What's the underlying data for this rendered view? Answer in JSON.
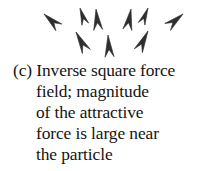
{
  "figure": {
    "label": "(c)",
    "background_color": "#ffffff",
    "ink_color": "#2e2e2e",
    "text_color": "#141414",
    "caption_lines": [
      "(c) Inverse square force",
      "field; magnitude",
      "of the attractive",
      "force is large near",
      "the particle"
    ],
    "caption_full_text": "(c) Inverse square force field; magnitude of the attractive force is large near the particle"
  },
  "vector_field": {
    "type": "inverse-square-attractive",
    "description": "Arrows converge toward a particle located above the visible crop",
    "convergence_point": {
      "x": 112,
      "y": -14
    },
    "arrow_count": 8,
    "arrows": [
      {
        "name": "arrow-upper-left-outer",
        "x": 44,
        "y": 14,
        "angle": -48,
        "length": 20,
        "width": 9
      },
      {
        "name": "arrow-upper-left-inner",
        "x": 80,
        "y": 8,
        "angle": -18,
        "length": 17,
        "width": 7
      },
      {
        "name": "arrow-upper-center-left",
        "x": 96,
        "y": 9,
        "angle": -6,
        "length": 21,
        "width": 9
      },
      {
        "name": "arrow-upper-center-right",
        "x": 131,
        "y": 9,
        "angle": 10,
        "length": 21,
        "width": 9
      },
      {
        "name": "arrow-upper-right-inner",
        "x": 148,
        "y": 8,
        "angle": 22,
        "length": 17,
        "width": 7
      },
      {
        "name": "arrow-upper-right-outer",
        "x": 183,
        "y": 14,
        "angle": 50,
        "length": 20,
        "width": 9
      },
      {
        "name": "arrow-lower-left",
        "x": 76,
        "y": 32,
        "angle": -28,
        "length": 22,
        "width": 9
      },
      {
        "name": "arrow-lower-center",
        "x": 108,
        "y": 35,
        "angle": -4,
        "length": 22,
        "width": 9
      },
      {
        "name": "arrow-lower-right",
        "x": 148,
        "y": 31,
        "angle": 26,
        "length": 22,
        "width": 9
      }
    ]
  }
}
